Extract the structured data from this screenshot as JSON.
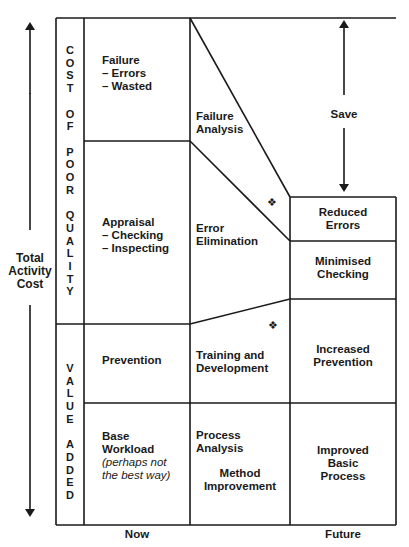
{
  "axis": {
    "left_label": [
      "Total",
      "Activity",
      "Cost"
    ],
    "x_labels": {
      "now": "Now",
      "future": "Future"
    }
  },
  "sections": {
    "cost_of_poor_quality": "COST OF POOR QUALITY",
    "value_added": "VALUE ADDED"
  },
  "now_column": {
    "failure": {
      "title": "Failure",
      "items": [
        "– Errors",
        "– Wasted"
      ]
    },
    "appraisal": {
      "title": "Appraisal",
      "items": [
        "–  Checking",
        "–  Inspecting"
      ]
    },
    "prevention": {
      "title": "Prevention"
    },
    "base": {
      "title1": "Base",
      "title2": "Workload",
      "note1": "(perhaps not",
      "note2": "the best way)"
    }
  },
  "actions_column": {
    "failure_analysis": [
      "Failure",
      "Analysis"
    ],
    "error_elimination": [
      "Error",
      "Elimination"
    ],
    "training": [
      "Training and",
      "Development"
    ],
    "process_analysis": [
      "Process",
      "Analysis"
    ],
    "method_improvement": [
      "Method",
      "Improvement"
    ]
  },
  "future_column": {
    "reduced_errors": [
      "Reduced",
      "Errors"
    ],
    "minimised_checking": [
      "Minimised",
      "Checking"
    ],
    "increased_prevention": [
      "Increased",
      "Prevention"
    ],
    "improved_basic": [
      "Improved",
      "Basic",
      "Process"
    ]
  },
  "save_label": "Save",
  "markers": {
    "symbol": "❖",
    "count": 2
  },
  "colors": {
    "line": "#1a1a1a",
    "background": "#ffffff"
  }
}
